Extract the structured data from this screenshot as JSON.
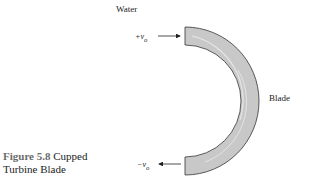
{
  "figure": {
    "number_label": "Figure 5.8",
    "title_line1": "Cupped",
    "title_line2": "Turbine Blade"
  },
  "labels": {
    "fluid": "Water",
    "blade": "Blade",
    "inflow_velocity": "+v",
    "inflow_sub": "o",
    "outflow_velocity": "−v",
    "outflow_sub": "o"
  },
  "colors": {
    "blade_fill": "#c8c8c8",
    "blade_stroke": "#333333",
    "caption_number": "#6b6b6b"
  }
}
